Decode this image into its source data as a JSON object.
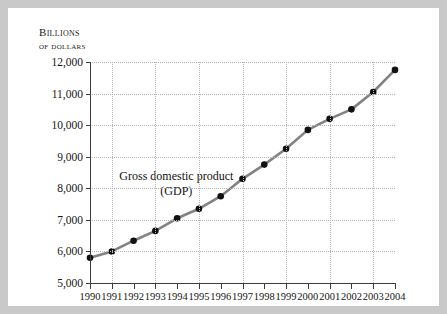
{
  "chart_data": {
    "type": "line",
    "title": "",
    "annotation": [
      "Gross domestic product",
      "(GDP)"
    ],
    "ylabel_lines": [
      "Billions",
      "of dollars"
    ],
    "xlabel": "",
    "categories": [
      1990,
      1991,
      1992,
      1993,
      1994,
      1995,
      1996,
      1997,
      1998,
      1999,
      2000,
      2001,
      2002,
      2003,
      2004
    ],
    "xtick_labels": [
      "1990",
      "1991",
      "1992",
      "1993",
      "1994",
      "1995",
      "1996",
      "1997",
      "1998",
      "1999",
      "2000",
      "2001",
      "2002",
      "2003",
      "2004"
    ],
    "values": [
      5800,
      6000,
      6340,
      6650,
      7050,
      7350,
      7750,
      8300,
      8750,
      9250,
      9850,
      10200,
      10500,
      11050,
      11750
    ],
    "ylim": [
      5000,
      12000
    ],
    "ytick_values": [
      5000,
      6000,
      7000,
      8000,
      9000,
      10000,
      11000,
      12000
    ],
    "ytick_labels": [
      "5,000",
      "6,000",
      "7,000",
      "8,000",
      "9,000",
      "10,000",
      "11,000",
      "12,000"
    ],
    "xlim": [
      1990,
      2004
    ],
    "grid": {
      "horizontal": true,
      "vertical": true,
      "vertical_years": [
        1991,
        1993,
        1995,
        1997,
        1999,
        2001,
        2003
      ]
    },
    "legend": "none",
    "series_name": "Gross domestic product (GDP)",
    "line_color": "#828282",
    "marker_color": "#111111",
    "grid_color": "#b4b4b4",
    "axis_color": "#3c3c3c",
    "frame_color": "#c9c9c9",
    "background_color": "#ffffff"
  }
}
